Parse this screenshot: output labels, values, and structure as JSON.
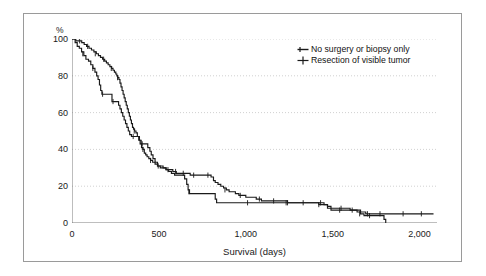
{
  "chart_data": {
    "type": "line",
    "title": "",
    "subtitle": "",
    "xlabel": "Survival (days)",
    "ylabel": "%",
    "xlim": [
      0,
      2100
    ],
    "ylim": [
      0,
      100
    ],
    "xticks": [
      0,
      500,
      1000,
      1500,
      2000
    ],
    "xtick_labels": [
      "0",
      "500",
      "1,000",
      "1,500",
      "2,000"
    ],
    "yticks": [
      0,
      20,
      40,
      60,
      80,
      100
    ],
    "ytick_labels": [
      "0",
      "20",
      "40",
      "60",
      "80",
      "100"
    ],
    "grid": "horizontal-dotted",
    "legend_position": "top-right",
    "series": [
      {
        "name": "No surgery or biopsy only",
        "marker": "line-with-tick",
        "color": "#1a1a1a",
        "points": [
          [
            0,
            100
          ],
          [
            18,
            98
          ],
          [
            30,
            96
          ],
          [
            42,
            95
          ],
          [
            55,
            93
          ],
          [
            68,
            91
          ],
          [
            80,
            89
          ],
          [
            95,
            88
          ],
          [
            108,
            86
          ],
          [
            120,
            84
          ],
          [
            132,
            82
          ],
          [
            142,
            80
          ],
          [
            150,
            78
          ],
          [
            158,
            75
          ],
          [
            165,
            72
          ],
          [
            172,
            70
          ],
          [
            182,
            70
          ],
          [
            196,
            70
          ],
          [
            210,
            70
          ],
          [
            222,
            70
          ],
          [
            230,
            66
          ],
          [
            245,
            66
          ],
          [
            258,
            66
          ],
          [
            268,
            64
          ],
          [
            276,
            62
          ],
          [
            284,
            60
          ],
          [
            292,
            58
          ],
          [
            300,
            56
          ],
          [
            308,
            54
          ],
          [
            316,
            52
          ],
          [
            324,
            50
          ],
          [
            332,
            48
          ],
          [
            342,
            47
          ],
          [
            356,
            47
          ],
          [
            372,
            47
          ],
          [
            388,
            45
          ],
          [
            398,
            43
          ],
          [
            410,
            43
          ],
          [
            424,
            43
          ],
          [
            436,
            41
          ],
          [
            448,
            39
          ],
          [
            456,
            37
          ],
          [
            466,
            35
          ],
          [
            478,
            33
          ],
          [
            492,
            31
          ],
          [
            508,
            31
          ],
          [
            524,
            30
          ],
          [
            540,
            29
          ],
          [
            556,
            28
          ],
          [
            572,
            27
          ],
          [
            590,
            26
          ],
          [
            610,
            26
          ],
          [
            630,
            26
          ],
          [
            648,
            24
          ],
          [
            660,
            21
          ],
          [
            668,
            18
          ],
          [
            676,
            16
          ],
          [
            690,
            16
          ],
          [
            710,
            16
          ],
          [
            730,
            16
          ],
          [
            750,
            16
          ],
          [
            770,
            16
          ],
          [
            790,
            16
          ],
          [
            810,
            16
          ],
          [
            824,
            13
          ],
          [
            832,
            11
          ],
          [
            860,
            11
          ],
          [
            900,
            11
          ],
          [
            950,
            11
          ],
          [
            1000,
            11
          ],
          [
            1060,
            11
          ],
          [
            1120,
            11
          ],
          [
            1180,
            11
          ],
          [
            1240,
            11
          ],
          [
            1300,
            11
          ],
          [
            1360,
            11
          ],
          [
            1420,
            10
          ],
          [
            1450,
            10
          ],
          [
            1470,
            9
          ],
          [
            1490,
            7
          ],
          [
            1510,
            7
          ],
          [
            1560,
            7
          ],
          [
            1600,
            7
          ],
          [
            1640,
            6
          ],
          [
            1660,
            5
          ],
          [
            1680,
            4
          ],
          [
            1700,
            4
          ],
          [
            1740,
            4
          ],
          [
            1780,
            4
          ],
          [
            1795,
            2
          ],
          [
            1805,
            0
          ]
        ],
        "censor_marks": [
          [
            62,
            92
          ],
          [
            120,
            84
          ],
          [
            176,
            70
          ],
          [
            236,
            66
          ],
          [
            352,
            47
          ],
          [
            404,
            43
          ],
          [
            672,
            17
          ],
          [
            1010,
            11
          ],
          [
            1240,
            11
          ],
          [
            1420,
            10
          ],
          [
            1540,
            7
          ],
          [
            1655,
            5
          ],
          [
            1712,
            4
          ]
        ]
      },
      {
        "name": "Resection of visible tumor",
        "marker": "plus",
        "color": "#1a1a1a",
        "points": [
          [
            0,
            100
          ],
          [
            22,
            99
          ],
          [
            40,
            99
          ],
          [
            56,
            98
          ],
          [
            70,
            97
          ],
          [
            84,
            96
          ],
          [
            98,
            95
          ],
          [
            112,
            94
          ],
          [
            126,
            93
          ],
          [
            140,
            92
          ],
          [
            152,
            91
          ],
          [
            164,
            90
          ],
          [
            176,
            89
          ],
          [
            188,
            88
          ],
          [
            198,
            87
          ],
          [
            208,
            86
          ],
          [
            218,
            85
          ],
          [
            228,
            84
          ],
          [
            236,
            83
          ],
          [
            244,
            82
          ],
          [
            252,
            81
          ],
          [
            258,
            80
          ],
          [
            264,
            79
          ],
          [
            270,
            78
          ],
          [
            276,
            76
          ],
          [
            282,
            74
          ],
          [
            288,
            72
          ],
          [
            294,
            70
          ],
          [
            300,
            68
          ],
          [
            306,
            66
          ],
          [
            312,
            64
          ],
          [
            318,
            62
          ],
          [
            324,
            60
          ],
          [
            330,
            58
          ],
          [
            336,
            56
          ],
          [
            342,
            54
          ],
          [
            348,
            52
          ],
          [
            354,
            51
          ],
          [
            360,
            50
          ],
          [
            368,
            49
          ],
          [
            376,
            47
          ],
          [
            384,
            45
          ],
          [
            392,
            43
          ],
          [
            400,
            41
          ],
          [
            408,
            40
          ],
          [
            416,
            38
          ],
          [
            424,
            37
          ],
          [
            432,
            36
          ],
          [
            442,
            35
          ],
          [
            452,
            34
          ],
          [
            464,
            33
          ],
          [
            478,
            32
          ],
          [
            492,
            31
          ],
          [
            508,
            30
          ],
          [
            524,
            30
          ],
          [
            542,
            29
          ],
          [
            560,
            29
          ],
          [
            580,
            28
          ],
          [
            600,
            27
          ],
          [
            620,
            27
          ],
          [
            640,
            27
          ],
          [
            660,
            27
          ],
          [
            680,
            26
          ],
          [
            700,
            26
          ],
          [
            720,
            26
          ],
          [
            740,
            26
          ],
          [
            760,
            26
          ],
          [
            780,
            26
          ],
          [
            800,
            25
          ],
          [
            814,
            23
          ],
          [
            824,
            22
          ],
          [
            840,
            21
          ],
          [
            856,
            20
          ],
          [
            872,
            19
          ],
          [
            888,
            18
          ],
          [
            904,
            17
          ],
          [
            920,
            17
          ],
          [
            940,
            16
          ],
          [
            960,
            15
          ],
          [
            980,
            15
          ],
          [
            1000,
            14
          ],
          [
            1030,
            14
          ],
          [
            1060,
            13
          ],
          [
            1090,
            12
          ],
          [
            1120,
            12
          ],
          [
            1160,
            12
          ],
          [
            1200,
            12
          ],
          [
            1240,
            11
          ],
          [
            1300,
            11
          ],
          [
            1360,
            11
          ],
          [
            1420,
            11
          ],
          [
            1450,
            10
          ],
          [
            1470,
            8
          ],
          [
            1520,
            8
          ],
          [
            1570,
            8
          ],
          [
            1600,
            7
          ],
          [
            1640,
            7
          ],
          [
            1660,
            6
          ],
          [
            1690,
            5
          ],
          [
            1720,
            5
          ],
          [
            1760,
            5
          ],
          [
            1800,
            5
          ],
          [
            1860,
            5
          ],
          [
            1920,
            5
          ],
          [
            1990,
            5
          ],
          [
            2080,
            5
          ]
        ],
        "censor_marks": [
          [
            44,
            99
          ],
          [
            90,
            96
          ],
          [
            134,
            92
          ],
          [
            182,
            89
          ],
          [
            226,
            84
          ],
          [
            262,
            79
          ],
          [
            358,
            50
          ],
          [
            408,
            40
          ],
          [
            452,
            34
          ],
          [
            496,
            31
          ],
          [
            552,
            29
          ],
          [
            596,
            28
          ],
          [
            640,
            27
          ],
          [
            700,
            26
          ],
          [
            782,
            26
          ],
          [
            880,
            18
          ],
          [
            968,
            15
          ],
          [
            1078,
            13
          ],
          [
            1160,
            12
          ],
          [
            1232,
            11
          ],
          [
            1330,
            11
          ],
          [
            1430,
            11
          ],
          [
            1548,
            8
          ],
          [
            1612,
            7
          ],
          [
            1700,
            5
          ],
          [
            1772,
            5
          ],
          [
            1905,
            5
          ],
          [
            2010,
            5
          ]
        ]
      }
    ]
  },
  "axes": {
    "y_unit_label": "%",
    "x_title": "Survival (days)"
  },
  "legend": {
    "entries": [
      {
        "label": "No surgery or biopsy only",
        "marker": "line-with-tick"
      },
      {
        "label": "Resection of visible tumor",
        "marker": "plus"
      }
    ]
  },
  "colors": {
    "line": "#1a1a1a",
    "grid": "#bdbdbd",
    "axis": "#6e6e6e",
    "frame": "#9a9a9a",
    "text": "#1a1a1a",
    "background": "#ffffff"
  }
}
